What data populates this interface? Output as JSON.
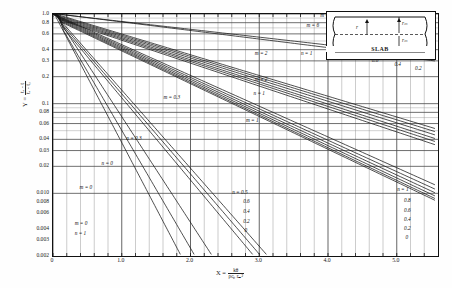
{
  "chart_data": {
    "type": "line",
    "title": "",
    "xlabel": "X = kθ / (ρ cₚ rₘ²)",
    "ylabel": "Y = (tₐ - t) / (tₐ - t₀)",
    "xlim": [
      0,
      5.6
    ],
    "ylim": [
      0.002,
      1.0
    ],
    "yscale": "log",
    "xscale": "linear",
    "grid": true,
    "legend_position": "none",
    "x_ticks": [
      "0",
      "1.0",
      "2.0",
      "3.0",
      "4.0",
      "5.0"
    ],
    "x_tick_values": [
      0,
      1.0,
      2.0,
      3.0,
      4.0,
      5.0
    ],
    "y_ticks": [
      "1.0",
      "0.8",
      "0.6",
      "0.4",
      "0.3",
      "0.2",
      "0.1",
      "0.08",
      "0.06",
      "0.04",
      "0.03",
      "0.02",
      "0.010",
      "0.008",
      "0.006",
      "0.004",
      "0.003",
      "0.002"
    ],
    "y_tick_values": [
      1.0,
      0.8,
      0.6,
      0.4,
      0.3,
      0.2,
      0.1,
      0.08,
      0.06,
      0.04,
      0.03,
      0.02,
      0.01,
      0.008,
      0.006,
      0.004,
      0.003,
      0.002
    ],
    "series": [
      {
        "name": "m = ∞, n = 1",
        "m": "inf",
        "n": 1,
        "y0": 1.0,
        "x_end": 5.55,
        "y_end": 0.33
      },
      {
        "name": "m = 6, n = 1",
        "m": 6,
        "n": 1,
        "y0": 1.0,
        "x_end": 5.55,
        "y_end": 0.3
      },
      {
        "name": "m = 2, n = 1",
        "m": 2,
        "n": 1,
        "y0": 0.97,
        "x_end": 5.55,
        "y_end": 0.053
      },
      {
        "name": "m = 2, n = 0.8",
        "m": 2,
        "n": 0.8,
        "y0": 0.95,
        "x_end": 5.55,
        "y_end": 0.049
      },
      {
        "name": "m = 2, n = 0.6",
        "m": 2,
        "n": 0.6,
        "y0": 0.93,
        "x_end": 5.55,
        "y_end": 0.045
      },
      {
        "name": "m = 2, n = 0.4",
        "m": 2,
        "n": 0.4,
        "y0": 0.91,
        "x_end": 5.55,
        "y_end": 0.041
      },
      {
        "name": "m = 2, n = 0.2",
        "m": 2,
        "n": 0.2,
        "y0": 0.89,
        "x_end": 5.55,
        "y_end": 0.038
      },
      {
        "name": "m = 2, n = 0",
        "m": 2,
        "n": 0,
        "y0": 0.87,
        "x_end": 5.55,
        "y_end": 0.035
      },
      {
        "name": "m = 1, n = 1",
        "m": 1,
        "n": 1,
        "y0": 0.92,
        "x_end": 5.55,
        "y_end": 0.0125
      },
      {
        "name": "m = 1, n = 0.8",
        "m": 1,
        "n": 0.8,
        "y0": 0.9,
        "x_end": 5.55,
        "y_end": 0.0112
      },
      {
        "name": "m = 1, n = 0.6",
        "m": 1,
        "n": 0.6,
        "y0": 0.88,
        "x_end": 5.55,
        "y_end": 0.0102
      },
      {
        "name": "m = 1, n = 0.4",
        "m": 1,
        "n": 0.4,
        "y0": 0.86,
        "x_end": 5.55,
        "y_end": 0.0094
      },
      {
        "name": "m = 1, n = 0.2",
        "m": 1,
        "n": 0.2,
        "y0": 0.84,
        "x_end": 5.55,
        "y_end": 0.0088
      },
      {
        "name": "m = 1, n = 0",
        "m": 1,
        "n": 0,
        "y0": 0.82,
        "x_end": 5.55,
        "y_end": 0.0084
      },
      {
        "name": "m = 0.3, n = 1",
        "m": 0.3,
        "n": 1,
        "y0": 0.8,
        "x_end": 3.1,
        "y_end": 0.0021
      },
      {
        "name": "m = 0.3, n = 0.5",
        "m": 0.3,
        "n": 0.5,
        "y0": 0.76,
        "x_end": 3.0,
        "y_end": 0.0021
      },
      {
        "name": "m = 0.3, n = 0",
        "m": 0.3,
        "n": 0,
        "y0": 0.72,
        "x_end": 2.9,
        "y_end": 0.0021
      },
      {
        "name": "m = 0, n = 1",
        "m": 0,
        "n": 1,
        "y0": 0.7,
        "x_end": 2.3,
        "y_end": 0.0021
      },
      {
        "name": "m = 0, n = 0.5",
        "m": 0,
        "n": 0.5,
        "y0": 0.64,
        "x_end": 2.05,
        "y_end": 0.0021
      },
      {
        "name": "m = 0, n = 0",
        "m": 0,
        "n": 0,
        "y0": 1.0,
        "x_end": 1.85,
        "y_end": 0.0021
      }
    ],
    "annotations": [
      {
        "id": "a-m-inf",
        "text": "m = ∞",
        "x": 3.9,
        "y": 0.92
      },
      {
        "id": "a-m-6",
        "text": "m = 6",
        "x": 3.7,
        "y": 0.72
      },
      {
        "id": "a-m-2-top",
        "text": "m = 2",
        "x": 2.95,
        "y": 0.345
      },
      {
        "id": "a-n-1-top",
        "text": "n = 1",
        "x": 3.62,
        "y": 0.345
      },
      {
        "id": "a-08-top",
        "text": "0.8",
        "x": 4.28,
        "y": 0.33
      },
      {
        "id": "a-06-top",
        "text": "0.6",
        "x": 4.65,
        "y": 0.295
      },
      {
        "id": "a-04-top",
        "text": "0.4",
        "x": 4.98,
        "y": 0.265
      },
      {
        "id": "a-02-top",
        "text": "0.2",
        "x": 5.28,
        "y": 0.24
      },
      {
        "id": "a-m-2b",
        "text": "m = 2",
        "x": 2.95,
        "y": 0.18
      },
      {
        "id": "a-n-1b",
        "text": "n = 1",
        "x": 2.93,
        "y": 0.125
      },
      {
        "id": "a-m-03",
        "text": "m = 0.3",
        "x": 1.62,
        "y": 0.112
      },
      {
        "id": "a-m-1",
        "text": "m = 1",
        "x": 2.82,
        "y": 0.062
      },
      {
        "id": "a-n-03",
        "text": "n = 0.3",
        "x": 1.08,
        "y": 0.039
      },
      {
        "id": "a-n-0",
        "text": "n = 0",
        "x": 0.72,
        "y": 0.0205
      },
      {
        "id": "a-m-0",
        "text": "m = 0",
        "x": 0.4,
        "y": 0.0112
      },
      {
        "id": "a-m0-n1",
        "text": "m = 0",
        "x": 0.33,
        "y": 0.0044
      },
      {
        "id": "a-m0-n1b",
        "text": "n = 1",
        "x": 0.33,
        "y": 0.0034
      },
      {
        "id": "a-n-05c",
        "text": "n = 0.5",
        "x": 2.62,
        "y": 0.0098
      },
      {
        "id": "a-06c",
        "text": "0.6",
        "x": 2.78,
        "y": 0.0078
      },
      {
        "id": "a-04c",
        "text": "0.4",
        "x": 2.78,
        "y": 0.006
      },
      {
        "id": "a-02c",
        "text": "0.2",
        "x": 2.78,
        "y": 0.0047
      },
      {
        "id": "a-0c",
        "text": "0",
        "x": 2.8,
        "y": 0.0037
      },
      {
        "id": "a-n-1r",
        "text": "n = 1",
        "x": 5.02,
        "y": 0.0105
      },
      {
        "id": "a-08r",
        "text": "0.8",
        "x": 5.12,
        "y": 0.008
      },
      {
        "id": "a-06r",
        "text": "0.6",
        "x": 5.12,
        "y": 0.0062
      },
      {
        "id": "a-04r",
        "text": "0.4",
        "x": 5.12,
        "y": 0.0049
      },
      {
        "id": "a-02r",
        "text": "0.2",
        "x": 5.12,
        "y": 0.0039
      },
      {
        "id": "a-0r",
        "text": "0",
        "x": 5.14,
        "y": 0.0031
      }
    ]
  },
  "axes": {
    "y_label_prefix": "Y =",
    "y_frac_num": "tₐ - t",
    "y_frac_den": "tₐ - t₀",
    "x_label_prefix": "X =",
    "x_frac_num": "kθ",
    "x_frac_den": "ρcₚ rₘ²"
  },
  "inset": {
    "caption": "SLAB",
    "label_r": "r",
    "label_rm_top": "rₘ",
    "label_rm_mid": "rₘ"
  },
  "colors": {
    "curve": "#151515",
    "grid_major": "#4a4a4a",
    "grid_minor": "#8d8d8d",
    "frame": "#111111",
    "background": "#ffffff"
  }
}
